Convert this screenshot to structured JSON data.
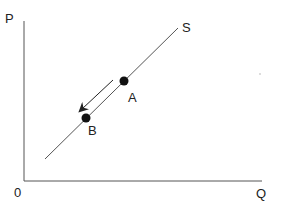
{
  "diagram": {
    "type": "supply-curve-movement",
    "axes": {
      "y_label": "P",
      "x_label": "Q",
      "origin_label": "0"
    },
    "curve": {
      "label": "S",
      "color": "#555555"
    },
    "points": [
      {
        "label": "A",
        "x": 124,
        "y": 81
      },
      {
        "label": "B",
        "x": 86,
        "y": 118
      }
    ],
    "arrow": {
      "direction": "down-left",
      "from": "A",
      "to": "B"
    },
    "colors": {
      "axis": "#555555",
      "point": "#111111",
      "text": "#222222"
    }
  }
}
